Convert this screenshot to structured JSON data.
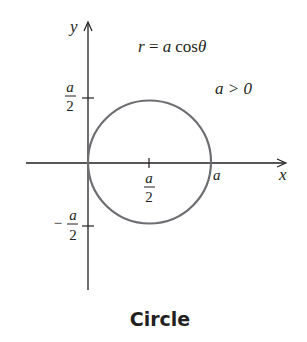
{
  "figure": {
    "equation": {
      "lhs": "r",
      "eq": " = ",
      "a": "a",
      "func": "cos",
      "theta": "θ"
    },
    "condition": "a > 0",
    "caption": "Circle",
    "axes": {
      "x_label": "x",
      "y_label": "y"
    },
    "ticks": {
      "x_half": {
        "num": "a",
        "den": "2"
      },
      "x_a": "a",
      "y_pos_half": {
        "num": "a",
        "den": "2"
      },
      "y_neg_half": {
        "sign": "−",
        "num": "a",
        "den": "2"
      }
    },
    "colors": {
      "curve": "#6d6e71",
      "axes": "#231f20",
      "text": "#231f20"
    },
    "circle": {
      "center": [
        "a/2",
        "0"
      ],
      "radius": "a/2"
    }
  }
}
